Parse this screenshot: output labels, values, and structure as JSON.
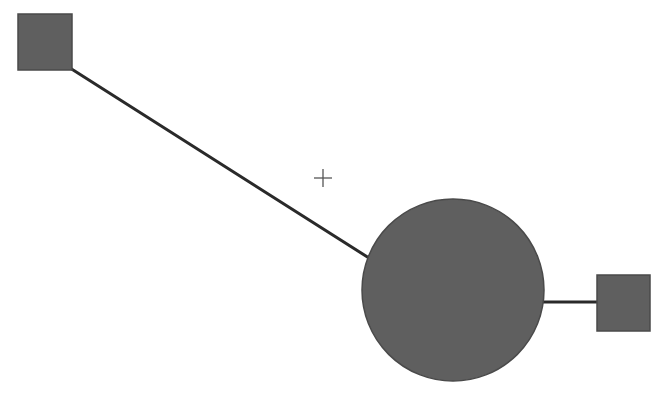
{
  "diagram": {
    "colors": {
      "node_fill": "#5f5f5f",
      "node_stroke": "#4a4a4a",
      "edge": "#2a2a2a",
      "crosshair": "#555555",
      "background": "#ffffff"
    },
    "nodes": [
      {
        "id": "square-left",
        "shape": "square",
        "x": 18,
        "y": 14,
        "w": 54,
        "h": 56
      },
      {
        "id": "circle-center",
        "shape": "circle",
        "cx": 453,
        "cy": 290,
        "r": 91
      },
      {
        "id": "square-right",
        "shape": "square",
        "x": 597,
        "y": 275,
        "w": 53,
        "h": 56
      }
    ],
    "edges": [
      {
        "from": "square-left",
        "to": "circle-center",
        "x1": 70,
        "y1": 68,
        "x2": 369,
        "y2": 258
      },
      {
        "from": "circle-center",
        "to": "square-right",
        "x1": 543,
        "y1": 302,
        "x2": 598,
        "y2": 302
      }
    ],
    "cursor": {
      "icon": "crosshair-icon",
      "cx": 323,
      "cy": 178,
      "arm": 9
    }
  }
}
